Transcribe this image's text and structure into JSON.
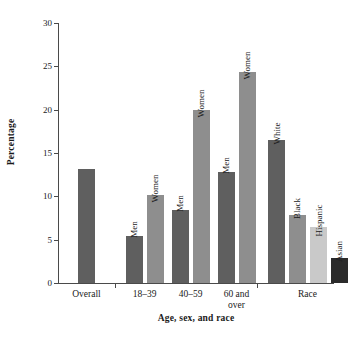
{
  "chart_data": {
    "type": "bar",
    "title": "",
    "xlabel": "Age, sex, and race",
    "ylabel": "Percentage",
    "ylim": [
      0,
      30
    ],
    "ytick_labels": [
      "0",
      "5",
      "10",
      "15",
      "20",
      "25",
      "30"
    ],
    "ytick_values": [
      0,
      5,
      10,
      15,
      20,
      25,
      30
    ],
    "grid": false,
    "legend": "none",
    "group_labels": [
      "Overall",
      "18–39",
      "40–59",
      "60 and\nover",
      "Race"
    ],
    "categories": [
      "Overall",
      "18–39 Men",
      "18–39 Women",
      "40–59 Men",
      "40–59 Women",
      "60 and over Men",
      "60 and over Women",
      "White",
      "Black",
      "Hispanic",
      "Asian"
    ],
    "bar_labels": [
      "",
      "Men",
      "Women",
      "Men",
      "Women",
      "Men",
      "Women",
      "White",
      "Black",
      "Hispanic",
      "Asian"
    ],
    "values": [
      13.1,
      5.4,
      10.2,
      8.4,
      20.0,
      12.8,
      24.3,
      16.5,
      7.8,
      6.5,
      2.9
    ],
    "bar_colors": [
      "#5f5f5f",
      "#5f5f5f",
      "#8e8e8e",
      "#5f5f5f",
      "#8e8e8e",
      "#5f5f5f",
      "#8e8e8e",
      "#5f5f5f",
      "#8e8e8e",
      "#c9c9c9",
      "#2b2b2b"
    ],
    "bars": [
      {
        "name": "overall",
        "label": "",
        "value": 13.1,
        "color": "#5f5f5f",
        "x": 20,
        "width": 17
      },
      {
        "name": "age-18-39-men",
        "label": "Men",
        "value": 5.4,
        "color": "#5f5f5f",
        "x": 68,
        "width": 17
      },
      {
        "name": "age-18-39-women",
        "label": "Women",
        "value": 10.2,
        "color": "#8e8e8e",
        "x": 89,
        "width": 17
      },
      {
        "name": "age-40-59-men",
        "label": "Men",
        "value": 8.4,
        "color": "#5f5f5f",
        "x": 114,
        "width": 17
      },
      {
        "name": "age-40-59-women",
        "label": "Women",
        "value": 20.0,
        "color": "#8e8e8e",
        "x": 135,
        "width": 17
      },
      {
        "name": "age-60-men",
        "label": "Men",
        "value": 12.8,
        "color": "#5f5f5f",
        "x": 160,
        "width": 17
      },
      {
        "name": "age-60-women",
        "label": "Women",
        "value": 24.3,
        "color": "#8e8e8e",
        "x": 181,
        "width": 17
      },
      {
        "name": "race-white",
        "label": "White",
        "value": 16.5,
        "color": "#5f5f5f",
        "x": 210,
        "width": 17
      },
      {
        "name": "race-black",
        "label": "Black",
        "value": 7.8,
        "color": "#8e8e8e",
        "x": 231,
        "width": 17
      },
      {
        "name": "race-hispanic",
        "label": "Hispanic",
        "value": 6.5,
        "color": "#c9c9c9",
        "x": 252,
        "width": 17
      },
      {
        "name": "race-asian",
        "label": "Asian",
        "value": 2.9,
        "color": "#2b2b2b",
        "x": 273,
        "width": 17
      }
    ],
    "groups": [
      {
        "name": "overall",
        "label": "Overall",
        "center": 28.5,
        "tick": 0
      },
      {
        "name": "age-18-39",
        "label": "18–39",
        "center": 86.5,
        "tick": 57
      },
      {
        "name": "age-40-59",
        "label": "40–59",
        "center": 132.5,
        "tick": 0
      },
      {
        "name": "age-60",
        "label": "60 and\nover",
        "center": 178.5,
        "tick": 0
      },
      {
        "name": "race",
        "label": "Race",
        "center": 249.5,
        "tick": 199
      }
    ],
    "axis_color": "#4a4a4a"
  }
}
